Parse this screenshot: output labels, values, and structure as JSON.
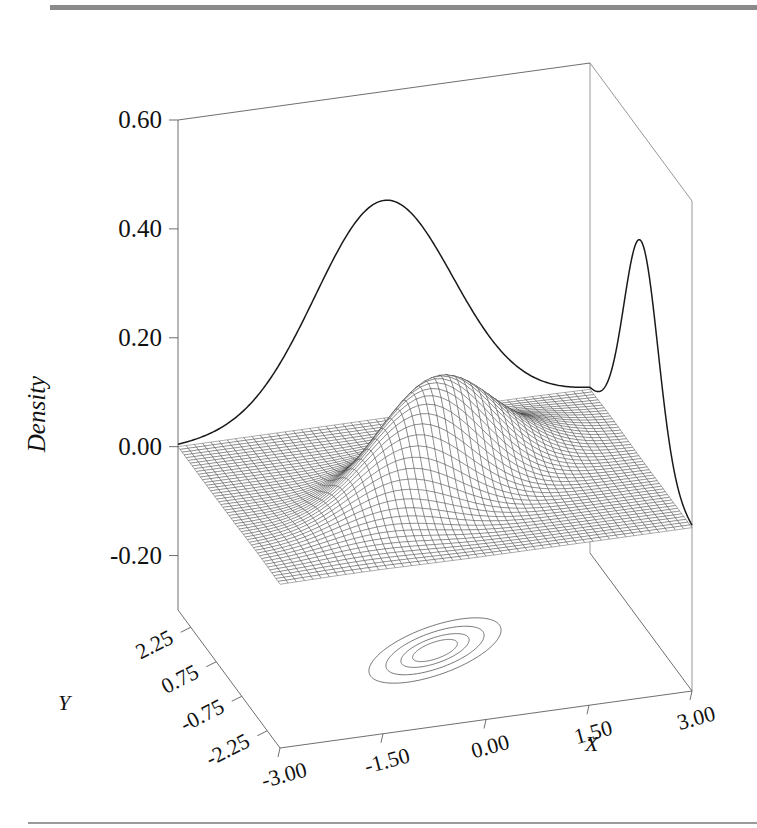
{
  "figure": {
    "type": "3d-surface-with-marginals-and-contours",
    "axis_labels": {
      "x": "X",
      "y": "Y",
      "z": "Density"
    },
    "rules": {
      "top": true,
      "bottom": true
    }
  },
  "chart_data": {
    "type": "surface",
    "title": "",
    "subtitle": "",
    "xlabel": "X",
    "ylabel": "Y",
    "zlabel": "Density",
    "xlim": [
      -3.0,
      3.0
    ],
    "ylim": [
      -3.0,
      3.0
    ],
    "zlim": [
      -0.3,
      0.6
    ],
    "xticks": [
      "-3.00",
      "-1.50",
      "0.00",
      "1.50",
      "3.00"
    ],
    "xtick_values": [
      -3.0,
      -1.5,
      0.0,
      1.5,
      3.0
    ],
    "yticks": [
      "2.25",
      "0.75",
      "-0.75",
      "-2.25"
    ],
    "ytick_values": [
      2.25,
      0.75,
      -0.75,
      -2.25
    ],
    "zticks": [
      "0.60",
      "0.40",
      "0.20",
      "0.00",
      "-0.20"
    ],
    "ztick_values": [
      0.6,
      0.4,
      0.2,
      0.0,
      -0.2
    ],
    "grid": false,
    "legend": "none",
    "distribution": {
      "name": "bivariate normal",
      "mean_x": 0.0,
      "mean_y": 0.0,
      "sigma_x": 1.0,
      "sigma_y": 1.0,
      "correlation": 0.6,
      "peak_density": 0.199
    },
    "surface": {
      "mesh_nx": 50,
      "mesh_ny": 50,
      "wireframe": true,
      "peak_value": 0.199
    },
    "marginals": [
      {
        "name": "x-marginal",
        "wall": "back-left",
        "peak_value": 0.4,
        "mean": 0.0,
        "sigma": 1.0
      },
      {
        "name": "y-marginal",
        "wall": "right",
        "peak_value": 0.4,
        "mean": 0.0,
        "sigma": 1.0
      }
    ],
    "contours": {
      "on_floor": true,
      "n_levels": 4,
      "levels": [
        0.03,
        0.07,
        0.12,
        0.16
      ],
      "orientation": "tilted-positive-correlation"
    }
  },
  "ticks_text": {
    "z": [
      "0.60",
      "0.40",
      "0.20",
      "0.00",
      "-0.20"
    ],
    "y": [
      "2.25",
      "0.75",
      "-0.75",
      "-2.25"
    ],
    "x": [
      "-3.00",
      "-1.50",
      "0.00",
      "1.50",
      "3.00"
    ]
  }
}
